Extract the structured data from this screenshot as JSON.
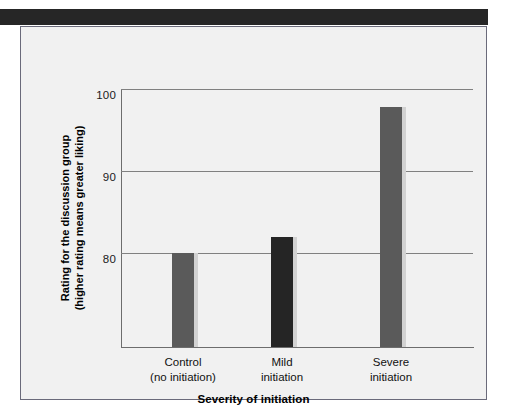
{
  "page": {
    "background_color": "#ffffff",
    "header_band_color": "#262626",
    "panel_background_color": "#f1f1f1",
    "panel_border_color": "#6a6a7a"
  },
  "chart_data": {
    "type": "bar",
    "title": "",
    "subtitle": "",
    "categories": [
      "Control\n(no initiation)",
      "Mild\ninitiation",
      "Severe\ninitiation"
    ],
    "category_lines": [
      [
        "Control",
        "(no initiation)"
      ],
      [
        "Mild",
        "initiation"
      ],
      [
        "Severe",
        "initiation"
      ]
    ],
    "values": [
      80.0,
      81.9,
      97.8
    ],
    "series": [
      {
        "name": "Rating for the discussion group",
        "values": [
          80.0,
          81.9,
          97.8
        ]
      }
    ],
    "bar_colors": [
      "#5a5a5a",
      "#252525",
      "#5a5a5a"
    ],
    "xlabel": "Severity of initiation",
    "ylabel": "Rating for the discussion group (higher rating means greater liking)",
    "ylabel_line1": "Rating for the discussion group",
    "ylabel_line2": "(higher rating means greater liking)",
    "ytick_labels": [
      "100",
      "90",
      "80"
    ],
    "ytick_values": [
      100,
      90,
      80
    ],
    "ylim": [
      68.5,
      100
    ],
    "grid": true,
    "grid_color": "#808080",
    "axis_color": "#6d6d6d",
    "legend": "none",
    "legend_position": "none"
  }
}
